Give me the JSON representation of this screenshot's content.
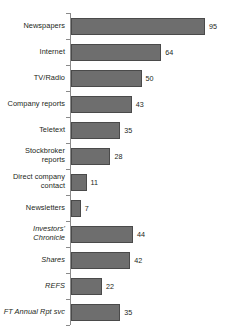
{
  "chart_data": {
    "type": "bar",
    "orientation": "horizontal",
    "title": "",
    "xlabel": "",
    "ylabel": "",
    "grid": false,
    "legend": false,
    "xlim": [
      0,
      95
    ],
    "categories": [
      "Newspapers",
      "Internet",
      "TV/Radio",
      "Company reports",
      "Teletext",
      "Stockbroker reports",
      "Direct company contact",
      "Newsletters",
      "Investors' Chronicle",
      "Shares",
      "REFS",
      "FT Annual Rpt svc"
    ],
    "values": [
      95,
      64,
      50,
      43,
      35,
      28,
      11,
      7,
      44,
      42,
      22,
      35
    ],
    "italic_categories": [
      "Investors' Chronicle",
      "Shares",
      "REFS",
      "FT Annual Rpt svc"
    ],
    "bar_color": "#6e6e6e",
    "bar_edge_color": "#4a4a4a",
    "axis_color": "#8a8a8a",
    "text_color": "#231f20"
  }
}
